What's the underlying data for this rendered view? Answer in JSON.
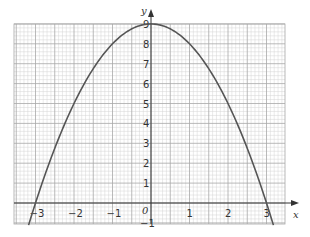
{
  "chart_data": {
    "type": "line",
    "title": "",
    "function": "y = 9 - x^2",
    "xlabel": "x",
    "ylabel": "y",
    "xlim": [
      -3.5,
      3.5
    ],
    "ylim": [
      -1,
      9
    ],
    "grid": true,
    "x_ticks": [
      -3,
      -2,
      -1,
      0,
      1,
      2,
      3
    ],
    "x_tick_labels": [
      "−3",
      "−2",
      "−1",
      "0",
      "1",
      "2",
      "3"
    ],
    "y_ticks": [
      -1,
      0,
      1,
      2,
      3,
      4,
      5,
      6,
      7,
      8,
      9
    ],
    "y_tick_labels": [
      "−1",
      "0",
      "1",
      "2",
      "3",
      "4",
      "5",
      "6",
      "7",
      "8",
      "9"
    ],
    "series": [
      {
        "name": "y = 9 − x²",
        "x": [
          -3.2,
          -3,
          -2.5,
          -2,
          -1.5,
          -1,
          -0.5,
          0,
          0.5,
          1,
          1.5,
          2,
          2.5,
          3,
          3.2
        ],
        "y": [
          -1.24,
          0,
          2.75,
          5,
          6.75,
          8,
          8.75,
          9,
          8.75,
          8,
          6.75,
          5,
          2.75,
          0,
          -1.24
        ]
      }
    ],
    "colors": {
      "curve": "#555555",
      "grid_major": "#a8a8a8",
      "grid_minor": "#d4d4d4",
      "axis": "#333333"
    }
  }
}
